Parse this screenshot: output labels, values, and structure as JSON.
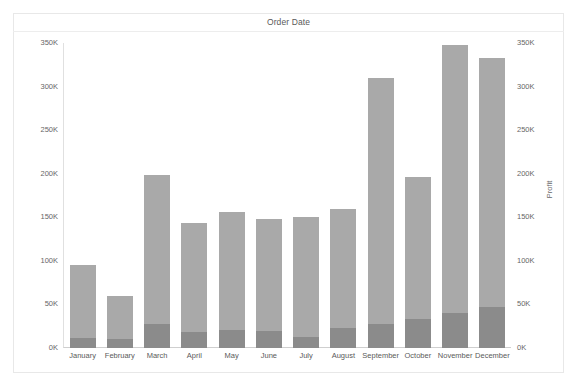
{
  "header": {
    "title": "Order Date"
  },
  "chart_data": {
    "type": "bar",
    "title": "Order Date",
    "xlabel": "",
    "ylabel": "Sales",
    "y2label": "Profit",
    "ylim": [
      0,
      350000
    ],
    "y2lim": [
      0,
      350000
    ],
    "grid": false,
    "legend": "none",
    "bar_style": "overlapping-dual-axis",
    "categories": [
      "January",
      "February",
      "March",
      "April",
      "May",
      "June",
      "July",
      "August",
      "September",
      "October",
      "November",
      "December"
    ],
    "yticks": [
      "0K",
      "50K",
      "100K",
      "150K",
      "200K",
      "250K",
      "300K",
      "350K"
    ],
    "ytick_values": [
      0,
      50000,
      100000,
      150000,
      200000,
      250000,
      300000,
      350000
    ],
    "y2ticks": [
      "0K",
      "50K",
      "100K",
      "150K",
      "200K",
      "250K",
      "300K",
      "350K"
    ],
    "y2tick_values": [
      0,
      50000,
      100000,
      150000,
      200000,
      250000,
      300000,
      350000
    ],
    "series": [
      {
        "name": "Sales",
        "axis": "left",
        "color": "#a9a9a9",
        "values": [
          95000,
          60000,
          198000,
          143000,
          156000,
          148000,
          150000,
          159000,
          310000,
          196000,
          348000,
          333000
        ]
      },
      {
        "name": "Profit",
        "axis": "right",
        "color": "#8b8b8b",
        "values": [
          12000,
          10000,
          27000,
          18000,
          21000,
          20000,
          13000,
          23000,
          27000,
          33000,
          40000,
          47000
        ]
      }
    ]
  },
  "colors": {
    "sales_bar": "#a9a9a9",
    "profit_bar": "#8b8b8b",
    "frame_border": "#e8e8e8",
    "axis_line": "#cfcfcf",
    "background": "#ffffff",
    "text": "#5a5a5a"
  }
}
